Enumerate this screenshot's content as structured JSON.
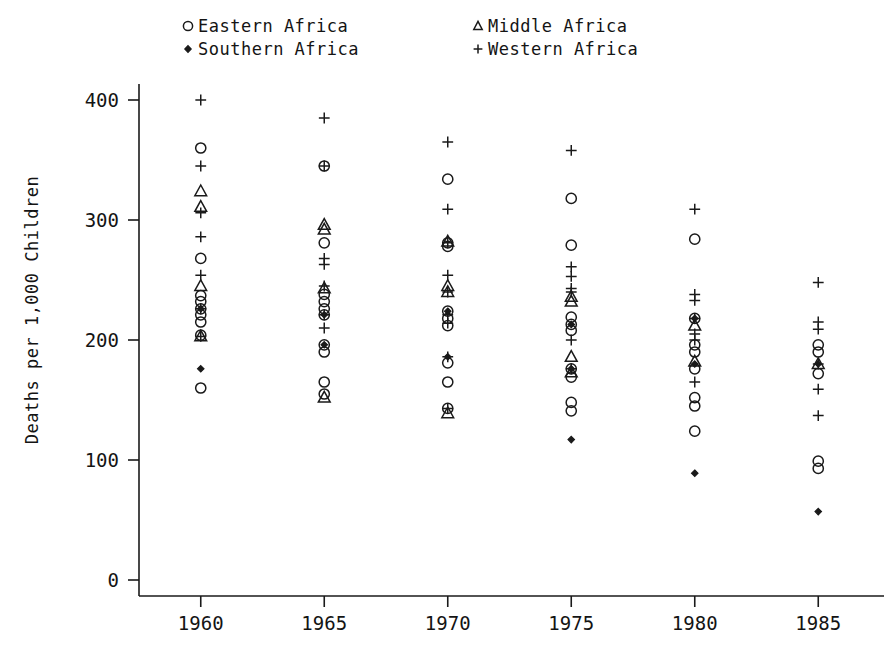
{
  "chart_data": {
    "type": "scatter",
    "title": "",
    "xlabel": "",
    "ylabel": "Deaths per 1,000 Children",
    "xlim": [
      1957.5,
      1987.5
    ],
    "ylim": [
      0,
      420
    ],
    "xticks": [
      1960,
      1965,
      1970,
      1975,
      1980,
      1985
    ],
    "yticks": [
      0,
      100,
      200,
      300,
      400
    ],
    "xtick_labels": [
      "1960",
      "1965",
      "1970",
      "1975",
      "1980",
      "1985"
    ],
    "ytick_labels": [
      "0",
      "100",
      "200",
      "300",
      "400"
    ],
    "grid": false,
    "legend_position": "top",
    "legend": [
      {
        "name": "Eastern Africa",
        "marker": "circle"
      },
      {
        "name": "Southern Africa",
        "marker": "diamond"
      },
      {
        "name": "Middle Africa",
        "marker": "triangle"
      },
      {
        "name": "Western Africa",
        "marker": "plus"
      }
    ],
    "series": [
      {
        "name": "Eastern Africa",
        "marker": "circle",
        "points": [
          [
            1960,
            360
          ],
          [
            1960,
            268
          ],
          [
            1960,
            237
          ],
          [
            1960,
            232
          ],
          [
            1960,
            226
          ],
          [
            1960,
            221
          ],
          [
            1960,
            215
          ],
          [
            1960,
            204
          ],
          [
            1960,
            160
          ],
          [
            1965,
            345
          ],
          [
            1965,
            281
          ],
          [
            1965,
            238
          ],
          [
            1965,
            232
          ],
          [
            1965,
            226
          ],
          [
            1965,
            221
          ],
          [
            1965,
            196
          ],
          [
            1965,
            190
          ],
          [
            1965,
            165
          ],
          [
            1965,
            155
          ],
          [
            1970,
            334
          ],
          [
            1970,
            281
          ],
          [
            1970,
            278
          ],
          [
            1970,
            224
          ],
          [
            1970,
            218
          ],
          [
            1970,
            212
          ],
          [
            1970,
            181
          ],
          [
            1970,
            165
          ],
          [
            1970,
            143
          ],
          [
            1975,
            318
          ],
          [
            1975,
            279
          ],
          [
            1975,
            219
          ],
          [
            1975,
            213
          ],
          [
            1975,
            208
          ],
          [
            1975,
            176
          ],
          [
            1975,
            169
          ],
          [
            1975,
            148
          ],
          [
            1975,
            141
          ],
          [
            1980,
            284
          ],
          [
            1980,
            218
          ],
          [
            1980,
            196
          ],
          [
            1980,
            190
          ],
          [
            1980,
            176
          ],
          [
            1980,
            152
          ],
          [
            1980,
            145
          ],
          [
            1980,
            124
          ],
          [
            1985,
            196
          ],
          [
            1985,
            190
          ],
          [
            1985,
            172
          ],
          [
            1985,
            99
          ],
          [
            1985,
            93
          ]
        ]
      },
      {
        "name": "Southern Africa",
        "marker": "diamond",
        "points": [
          [
            1960,
            226
          ],
          [
            1960,
            176
          ],
          [
            1965,
            221
          ],
          [
            1965,
            196
          ],
          [
            1970,
            224
          ],
          [
            1970,
            186
          ],
          [
            1975,
            213
          ],
          [
            1975,
            176
          ],
          [
            1975,
            117
          ],
          [
            1980,
            218
          ],
          [
            1980,
            180
          ],
          [
            1980,
            89
          ],
          [
            1985,
            180
          ],
          [
            1985,
            57
          ]
        ]
      },
      {
        "name": "Middle Africa",
        "marker": "triangle",
        "points": [
          [
            1960,
            324
          ],
          [
            1960,
            311
          ],
          [
            1960,
            245
          ],
          [
            1960,
            203
          ],
          [
            1965,
            296
          ],
          [
            1965,
            292
          ],
          [
            1965,
            243
          ],
          [
            1965,
            152
          ],
          [
            1970,
            282
          ],
          [
            1970,
            245
          ],
          [
            1970,
            240
          ],
          [
            1970,
            139
          ],
          [
            1975,
            236
          ],
          [
            1975,
            232
          ],
          [
            1975,
            186
          ],
          [
            1975,
            173
          ],
          [
            1980,
            212
          ],
          [
            1980,
            182
          ],
          [
            1985,
            180
          ]
        ]
      },
      {
        "name": "Western Africa",
        "marker": "plus",
        "points": [
          [
            1960,
            400
          ],
          [
            1960,
            345
          ],
          [
            1960,
            306
          ],
          [
            1960,
            286
          ],
          [
            1960,
            254
          ],
          [
            1960,
            226
          ],
          [
            1960,
            203
          ],
          [
            1965,
            385
          ],
          [
            1965,
            345
          ],
          [
            1965,
            268
          ],
          [
            1965,
            263
          ],
          [
            1965,
            245
          ],
          [
            1965,
            221
          ],
          [
            1965,
            210
          ],
          [
            1970,
            365
          ],
          [
            1970,
            309
          ],
          [
            1970,
            281
          ],
          [
            1970,
            254
          ],
          [
            1970,
            240
          ],
          [
            1970,
            221
          ],
          [
            1970,
            214
          ],
          [
            1970,
            186
          ],
          [
            1970,
            143
          ],
          [
            1975,
            358
          ],
          [
            1975,
            261
          ],
          [
            1975,
            253
          ],
          [
            1975,
            243
          ],
          [
            1975,
            240
          ],
          [
            1975,
            200
          ],
          [
            1975,
            176
          ],
          [
            1980,
            309
          ],
          [
            1980,
            238
          ],
          [
            1980,
            233
          ],
          [
            1980,
            218
          ],
          [
            1980,
            205
          ],
          [
            1980,
            200
          ],
          [
            1980,
            165
          ],
          [
            1985,
            248
          ],
          [
            1985,
            215
          ],
          [
            1985,
            209
          ],
          [
            1985,
            180
          ],
          [
            1985,
            159
          ],
          [
            1985,
            137
          ]
        ]
      }
    ]
  }
}
